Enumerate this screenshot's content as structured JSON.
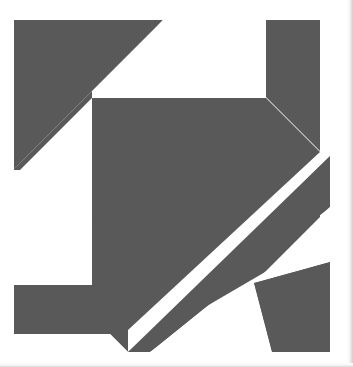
{
  "page": {
    "width": 353,
    "height": 367,
    "background": "#ffffff",
    "caption_text": "concerning the circle."
  },
  "figure": {
    "name": "abstract-geometric-composition",
    "colors": {
      "shape_fill": "#595959",
      "shape_stroke": "#4a4a4a",
      "background": "#ffffff",
      "paper_shadow": "#d0d0d0"
    },
    "bounds": {
      "left": 14,
      "top": 20,
      "right": 330,
      "bottom": 352
    },
    "shapes": [
      {
        "name": "upper-left-dark-triangle",
        "fill": "#595959",
        "points": "14,20 163,20 14,169"
      },
      {
        "name": "top-right-dark-block",
        "fill": "#595959",
        "points": "266,20 320,20 320,152 266,98"
      },
      {
        "name": "central-large-dark-polygon",
        "fill": "#595959",
        "points": "92,98 266,98 320,152 320,200 92,200"
      },
      {
        "name": "mid-left-dark-band",
        "fill": "#595959",
        "points": "14,169 92,98 92,200 14,248"
      },
      {
        "name": "lower-left-dark-region",
        "fill": "#595959",
        "points": "14,285 92,285 92,200 320,200 320,240 110,334 14,334"
      },
      {
        "name": "lower-diagonal-dark-band",
        "fill": "#595959",
        "points": "246,240 330,156 330,206 150,352 128,352"
      },
      {
        "name": "bottom-right-dark-triangle",
        "fill": "#595959",
        "points": "254,283 330,262 330,352 272,352"
      }
    ],
    "white_regions": [
      {
        "name": "upper-white-rectangle",
        "fill": "#ffffff",
        "points": "163,20 266,20 266,98 92,98"
      },
      {
        "name": "left-white-diagonal-strip",
        "fill": "#ffffff",
        "points": "14,169 92,98 92,200 14,248"
      },
      {
        "name": "lower-left-white-rectangle",
        "fill": "#ffffff",
        "points": "14,170 92,170 92,285 14,285"
      },
      {
        "name": "right-white-diagonal-strip",
        "fill": "#ffffff",
        "points": "320,152 330,156 246,240 236,236"
      },
      {
        "name": "bottom-white-triangle",
        "fill": "#ffffff",
        "points": "254,283 272,352 150,352"
      },
      {
        "name": "right-lower-white-wedge",
        "fill": "#ffffff",
        "points": "330,206 330,262 254,283"
      }
    ]
  }
}
